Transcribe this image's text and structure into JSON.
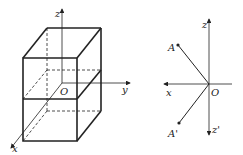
{
  "figure_left": {
    "description": "Rectangular box (cuboid) with spatial coordinate system; horizontal plane through origin",
    "labels": {
      "z": "z",
      "y": "y",
      "x": "x",
      "origin": "O"
    }
  },
  "figure_right": {
    "description": "Coordinate plane xOz with point A and its reflection A' across x-axis",
    "labels": {
      "z": "z",
      "z_prime": "z'",
      "x": "x",
      "origin": "O",
      "point_a": "A",
      "point_a_prime": "A'"
    }
  },
  "colors": {
    "line": "#222222",
    "background": "#ffffff"
  }
}
